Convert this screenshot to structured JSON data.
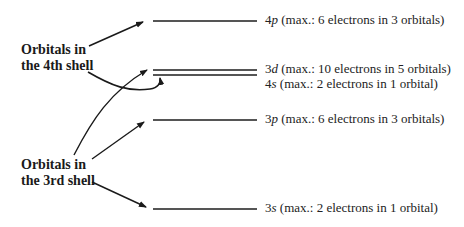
{
  "diagram": {
    "groups": [
      {
        "line1": "Orbitals in",
        "line2": "the 4th shell"
      },
      {
        "line1": "Orbitals in",
        "line2": "the 3rd shell"
      }
    ],
    "levels": [
      {
        "orbital_num": "4",
        "orbital_letter": "p",
        "desc": " (max.: 6 electrons in 3 orbitals)"
      },
      {
        "orbital_num": "3",
        "orbital_letter": "d",
        "desc": " (max.: 10 electrons in 5 orbitals)"
      },
      {
        "orbital_num": "4",
        "orbital_letter": "s",
        "desc": " (max.: 2 electrons in 1 orbital)"
      },
      {
        "orbital_num": "3",
        "orbital_letter": "p",
        "desc": " (max.: 6 electrons in 3 orbitals)"
      },
      {
        "orbital_num": "3",
        "orbital_letter": "s",
        "desc": " (max.: 2 electrons in 1 orbital)"
      }
    ],
    "colors": {
      "line": "#555555",
      "arrow": "#1a1a1a",
      "text": "#222222"
    }
  }
}
